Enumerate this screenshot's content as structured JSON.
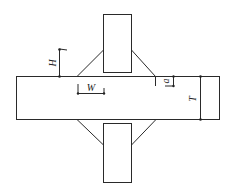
{
  "diagram": {
    "type": "welded cross-joint schematic",
    "labels": {
      "H": "H",
      "W": "W",
      "T": "T",
      "a": "a"
    },
    "colors": {
      "line": "#2a2a2a",
      "background": "#ffffff"
    }
  }
}
